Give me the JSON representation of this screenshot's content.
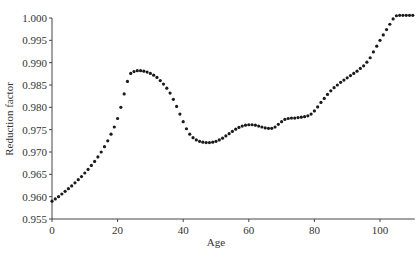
{
  "chart_data": {
    "type": "scatter",
    "title": "",
    "xlabel": "Age",
    "ylabel": "Reduction factor",
    "xlim": [
      0,
      110
    ],
    "ylim": [
      0.955,
      1.0
    ],
    "xticks": [
      0,
      20,
      40,
      60,
      80,
      100
    ],
    "xtick_labels": [
      "0",
      "20",
      "40",
      "60",
      "80",
      "100"
    ],
    "yticks": [
      0.955,
      0.96,
      0.965,
      0.97,
      0.975,
      0.98,
      0.985,
      0.99,
      0.995,
      1.0
    ],
    "ytick_labels": [
      "0.955",
      "0.960",
      "0.965",
      "0.970",
      "0.975",
      "0.980",
      "0.985",
      "0.990",
      "0.995",
      "1.000"
    ],
    "grid": false,
    "legend": null,
    "marker_color": "#1a1a1a",
    "series": [
      {
        "name": "Reduction factor",
        "x": [
          0,
          1,
          2,
          3,
          4,
          5,
          6,
          7,
          8,
          9,
          10,
          11,
          12,
          13,
          14,
          15,
          16,
          17,
          18,
          19,
          20,
          21,
          22,
          23,
          24,
          25,
          26,
          27,
          28,
          29,
          30,
          31,
          32,
          33,
          34,
          35,
          36,
          37,
          38,
          39,
          40,
          41,
          42,
          43,
          44,
          45,
          46,
          47,
          48,
          49,
          50,
          51,
          52,
          53,
          54,
          55,
          56,
          57,
          58,
          59,
          60,
          61,
          62,
          63,
          64,
          65,
          66,
          67,
          68,
          69,
          70,
          71,
          72,
          73,
          74,
          75,
          76,
          77,
          78,
          79,
          80,
          81,
          82,
          83,
          84,
          85,
          86,
          87,
          88,
          89,
          90,
          91,
          92,
          93,
          94,
          95,
          96,
          97,
          98,
          99,
          100,
          101,
          102,
          103,
          104,
          105,
          106,
          107,
          108,
          109,
          110
        ],
        "values": [
          0.959,
          0.9595,
          0.96,
          0.9606,
          0.9612,
          0.9618,
          0.9624,
          0.9631,
          0.9638,
          0.9645,
          0.9653,
          0.9661,
          0.967,
          0.9679,
          0.9689,
          0.97,
          0.9712,
          0.9725,
          0.974,
          0.9756,
          0.9775,
          0.98,
          0.983,
          0.9858,
          0.9876,
          0.988,
          0.9882,
          0.9882,
          0.9881,
          0.9879,
          0.9876,
          0.9872,
          0.9867,
          0.986,
          0.9852,
          0.9843,
          0.9832,
          0.9818,
          0.9802,
          0.9785,
          0.9768,
          0.9752,
          0.974,
          0.9732,
          0.9727,
          0.9724,
          0.9722,
          0.9721,
          0.9721,
          0.9722,
          0.9724,
          0.9727,
          0.9731,
          0.9736,
          0.9741,
          0.9746,
          0.9751,
          0.9755,
          0.9758,
          0.976,
          0.9761,
          0.9761,
          0.976,
          0.9758,
          0.9756,
          0.9754,
          0.9753,
          0.9753,
          0.9756,
          0.9762,
          0.9768,
          0.9773,
          0.9775,
          0.9776,
          0.9776,
          0.9777,
          0.9778,
          0.9779,
          0.9781,
          0.9785,
          0.9792,
          0.9801,
          0.9811,
          0.982,
          0.9829,
          0.9837,
          0.9844,
          0.985,
          0.9856,
          0.9861,
          0.9866,
          0.9871,
          0.9876,
          0.9881,
          0.9887,
          0.9893,
          0.9901,
          0.9911,
          0.9924,
          0.9937,
          0.995,
          0.9962,
          0.9974,
          0.9986,
          0.9998,
          1.0005,
          1.0006,
          1.0006,
          1.0006,
          1.0006,
          1.0006
        ]
      }
    ]
  },
  "plot_area": {
    "x0_px": 52,
    "x100_px": 380,
    "y_top_value_px": 18,
    "y_bottom_value_px": 219
  }
}
